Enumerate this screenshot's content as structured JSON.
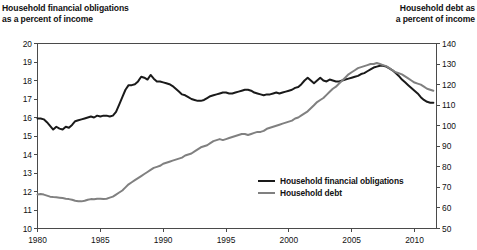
{
  "titles": {
    "left": "Household financial obligations\nas a percent of income",
    "right": "Household debt as\na percent of income"
  },
  "legend": {
    "items": [
      {
        "label": "Household financial obligations",
        "color": "#1a1a1a"
      },
      {
        "label": "Household debt",
        "color": "#808080"
      }
    ]
  },
  "axes": {
    "left_ticks": [
      "20",
      "19",
      "18",
      "17",
      "16",
      "15",
      "14",
      "13",
      "12",
      "11",
      "10"
    ],
    "right_ticks": [
      "140",
      "130",
      "120",
      "110",
      "100",
      "90",
      "80",
      "70",
      "60",
      "50"
    ],
    "x_ticks": [
      "1980",
      "1985",
      "1990",
      "1995",
      "2000",
      "2005",
      "2010"
    ]
  },
  "chart_data": {
    "type": "line",
    "title": "",
    "xlabel": "",
    "ylabel": "Household financial obligations as a percent of income",
    "y2label": "Household debt as a percent of income",
    "xlim": [
      1980,
      2011.75
    ],
    "ylim": [
      10,
      20
    ],
    "y2lim": [
      50,
      140
    ],
    "grid": false,
    "legend_position": "center-right-inside",
    "x_tick_values": [
      1980,
      1985,
      1990,
      1995,
      2000,
      2005,
      2010
    ],
    "y_tick_values": [
      10,
      11,
      12,
      13,
      14,
      15,
      16,
      17,
      18,
      19,
      20
    ],
    "y2_tick_values": [
      50,
      60,
      70,
      80,
      90,
      100,
      110,
      120,
      130,
      140
    ],
    "series": [
      {
        "name": "Household financial obligations",
        "color": "#1a1a1a",
        "axis": "left",
        "units": "percent of income",
        "x": [
          1980.0,
          1980.25,
          1980.5,
          1980.75,
          1981.0,
          1981.25,
          1981.5,
          1981.75,
          1982.0,
          1982.25,
          1982.5,
          1982.75,
          1983.0,
          1983.25,
          1983.5,
          1983.75,
          1984.0,
          1984.25,
          1984.5,
          1984.75,
          1985.0,
          1985.25,
          1985.5,
          1985.75,
          1986.0,
          1986.25,
          1986.5,
          1986.75,
          1987.0,
          1987.25,
          1987.5,
          1987.75,
          1988.0,
          1988.25,
          1988.5,
          1988.75,
          1989.0,
          1989.25,
          1989.5,
          1989.75,
          1990.0,
          1990.25,
          1990.5,
          1990.75,
          1991.0,
          1991.25,
          1991.5,
          1991.75,
          1992.0,
          1992.25,
          1992.5,
          1992.75,
          1993.0,
          1993.25,
          1993.5,
          1993.75,
          1994.0,
          1994.25,
          1994.5,
          1994.75,
          1995.0,
          1995.25,
          1995.5,
          1995.75,
          1996.0,
          1996.25,
          1996.5,
          1996.75,
          1997.0,
          1997.25,
          1997.5,
          1997.75,
          1998.0,
          1998.25,
          1998.5,
          1998.75,
          1999.0,
          1999.25,
          1999.5,
          1999.75,
          2000.0,
          2000.25,
          2000.5,
          2000.75,
          2001.0,
          2001.25,
          2001.5,
          2001.75,
          2002.0,
          2002.25,
          2002.5,
          2002.75,
          2003.0,
          2003.25,
          2003.5,
          2003.75,
          2004.0,
          2004.25,
          2004.5,
          2004.75,
          2005.0,
          2005.25,
          2005.5,
          2005.75,
          2006.0,
          2006.25,
          2006.5,
          2006.75,
          2007.0,
          2007.25,
          2007.5,
          2007.75,
          2008.0,
          2008.25,
          2008.5,
          2008.75,
          2009.0,
          2009.25,
          2009.5,
          2009.75,
          2010.0,
          2010.25,
          2010.5,
          2010.75,
          2011.0,
          2011.25,
          2011.5
        ],
        "y": [
          15.95,
          15.95,
          15.9,
          15.75,
          15.55,
          15.35,
          15.5,
          15.4,
          15.35,
          15.5,
          15.45,
          15.6,
          15.8,
          15.85,
          15.9,
          15.95,
          16.0,
          16.05,
          16.0,
          16.1,
          16.05,
          16.1,
          16.1,
          16.05,
          16.1,
          16.3,
          16.7,
          17.1,
          17.5,
          17.75,
          17.75,
          17.8,
          17.95,
          18.2,
          18.15,
          18.05,
          18.3,
          18.1,
          17.95,
          17.95,
          17.9,
          17.85,
          17.8,
          17.7,
          17.55,
          17.4,
          17.25,
          17.2,
          17.1,
          17.0,
          16.95,
          16.9,
          16.9,
          16.95,
          17.05,
          17.15,
          17.2,
          17.25,
          17.3,
          17.35,
          17.35,
          17.3,
          17.3,
          17.35,
          17.4,
          17.45,
          17.5,
          17.5,
          17.45,
          17.35,
          17.3,
          17.25,
          17.2,
          17.25,
          17.25,
          17.3,
          17.35,
          17.3,
          17.35,
          17.4,
          17.45,
          17.5,
          17.6,
          17.65,
          17.8,
          18.0,
          18.15,
          18.0,
          17.85,
          18.0,
          18.15,
          18.0,
          17.95,
          18.05,
          18.0,
          17.95,
          17.95,
          18.0,
          18.05,
          18.1,
          18.15,
          18.2,
          18.25,
          18.35,
          18.4,
          18.5,
          18.6,
          18.7,
          18.75,
          18.8,
          18.8,
          18.75,
          18.65,
          18.55,
          18.4,
          18.25,
          18.05,
          17.9,
          17.75,
          17.6,
          17.45,
          17.3,
          17.1,
          16.95,
          16.85,
          16.8,
          16.8
        ]
      },
      {
        "name": "Household debt",
        "color": "#808080",
        "axis": "right",
        "units": "percent of income",
        "x": [
          1980.0,
          1980.25,
          1980.5,
          1980.75,
          1981.0,
          1981.25,
          1981.5,
          1981.75,
          1982.0,
          1982.25,
          1982.5,
          1982.75,
          1983.0,
          1983.25,
          1983.5,
          1983.75,
          1984.0,
          1984.25,
          1984.5,
          1984.75,
          1985.0,
          1985.25,
          1985.5,
          1985.75,
          1986.0,
          1986.25,
          1986.5,
          1986.75,
          1987.0,
          1987.25,
          1987.5,
          1987.75,
          1988.0,
          1988.25,
          1988.5,
          1988.75,
          1989.0,
          1989.25,
          1989.5,
          1989.75,
          1990.0,
          1990.25,
          1990.5,
          1990.75,
          1991.0,
          1991.25,
          1991.5,
          1991.75,
          1992.0,
          1992.25,
          1992.5,
          1992.75,
          1993.0,
          1993.25,
          1993.5,
          1993.75,
          1994.0,
          1994.25,
          1994.5,
          1994.75,
          1995.0,
          1995.25,
          1995.5,
          1995.75,
          1996.0,
          1996.25,
          1996.5,
          1996.75,
          1997.0,
          1997.25,
          1997.5,
          1997.75,
          1998.0,
          1998.25,
          1998.5,
          1998.75,
          1999.0,
          1999.25,
          1999.5,
          1999.75,
          2000.0,
          2000.25,
          2000.5,
          2000.75,
          2001.0,
          2001.25,
          2001.5,
          2001.75,
          2002.0,
          2002.25,
          2002.5,
          2002.75,
          2003.0,
          2003.25,
          2003.5,
          2003.75,
          2004.0,
          2004.25,
          2004.5,
          2004.75,
          2005.0,
          2005.25,
          2005.5,
          2005.75,
          2006.0,
          2006.25,
          2006.5,
          2006.75,
          2007.0,
          2007.25,
          2007.5,
          2007.75,
          2008.0,
          2008.25,
          2008.5,
          2008.75,
          2009.0,
          2009.25,
          2009.5,
          2009.75,
          2010.0,
          2010.25,
          2010.5,
          2010.75,
          2011.0,
          2011.25,
          2011.5
        ],
        "y": [
          66.5,
          66.8,
          66.5,
          66.0,
          65.5,
          65.3,
          65.2,
          65.0,
          64.8,
          64.5,
          64.3,
          64.0,
          63.5,
          63.3,
          63.2,
          63.5,
          64.0,
          64.3,
          64.2,
          64.5,
          64.5,
          64.3,
          64.5,
          65.0,
          65.5,
          66.5,
          67.5,
          68.5,
          70.0,
          71.5,
          72.5,
          73.5,
          74.5,
          75.5,
          76.5,
          77.5,
          78.5,
          79.5,
          80.0,
          80.5,
          81.5,
          82.0,
          82.5,
          83.0,
          83.5,
          84.0,
          84.5,
          85.5,
          86.0,
          86.5,
          87.5,
          88.5,
          89.5,
          90.0,
          90.5,
          91.5,
          92.5,
          93.0,
          93.5,
          93.0,
          93.5,
          94.0,
          94.5,
          95.0,
          95.5,
          96.0,
          96.0,
          95.5,
          96.0,
          96.5,
          97.0,
          97.0,
          97.5,
          98.5,
          99.0,
          99.5,
          100.0,
          100.5,
          101.0,
          101.5,
          102.0,
          102.5,
          103.5,
          104.0,
          105.0,
          106.0,
          107.0,
          108.5,
          110.0,
          111.5,
          112.5,
          113.5,
          115.0,
          116.5,
          118.0,
          119.0,
          120.5,
          122.0,
          123.5,
          125.0,
          126.0,
          127.0,
          128.0,
          128.5,
          129.0,
          129.5,
          130.0,
          130.0,
          130.5,
          130.0,
          129.5,
          129.0,
          128.0,
          127.0,
          126.0,
          125.5,
          125.0,
          124.0,
          123.0,
          122.0,
          121.0,
          120.5,
          120.0,
          119.0,
          118.0,
          117.5,
          117.0
        ]
      }
    ]
  }
}
